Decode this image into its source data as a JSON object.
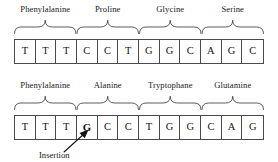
{
  "figure": {
    "type": "genetics-codon-frameshift-diagram",
    "ink_color": "#4a4a4a",
    "text_color": "#191919",
    "background": "#ffffff"
  },
  "top_strand": {
    "name": "original-sequence",
    "bases": [
      "T",
      "T",
      "T",
      "C",
      "C",
      "T",
      "G",
      "G",
      "C",
      "A",
      "G",
      "C"
    ],
    "codons": [
      {
        "label": "Phenylalanine",
        "bases": [
          "T",
          "T",
          "T"
        ]
      },
      {
        "label": "Proline",
        "bases": [
          "C",
          "C",
          "T"
        ]
      },
      {
        "label": "Glycine",
        "bases": [
          "G",
          "G",
          "C"
        ]
      },
      {
        "label": "Serine",
        "bases": [
          "A",
          "G",
          "C"
        ]
      }
    ]
  },
  "bottom_strand": {
    "name": "mutated-sequence",
    "bases": [
      "T",
      "T",
      "T",
      "G",
      "C",
      "C",
      "T",
      "G",
      "G",
      "C",
      "A",
      "G"
    ],
    "bold_index": 3,
    "codons": [
      {
        "label": "Phenylalanine",
        "bases": [
          "T",
          "T",
          "T"
        ]
      },
      {
        "label": "Alanine",
        "bases": [
          "G",
          "C",
          "C"
        ]
      },
      {
        "label": "Tryptophane",
        "bases": [
          "T",
          "G",
          "G"
        ]
      },
      {
        "label": "Glutamine",
        "bases": [
          "C",
          "A",
          "G"
        ]
      }
    ],
    "annotation": {
      "label": "Insertion",
      "points_to_base": "G"
    }
  }
}
